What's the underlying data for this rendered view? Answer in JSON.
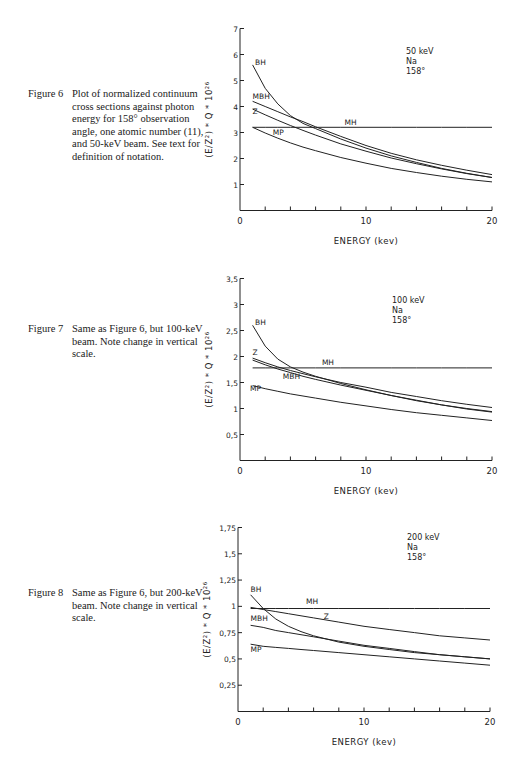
{
  "figures": [
    {
      "id": "fig6",
      "caption_label": "Figure 6",
      "caption_text": "Plot of normalized continuum cross sections against photon energy for 158° observation angle, one atomic number (11), and 50-keV beam. See text for definition of notation.",
      "annotation": [
        "50 keV",
        "Na",
        "158°"
      ]
    },
    {
      "id": "fig7",
      "caption_label": "Figure 7",
      "caption_text": "Same as Figure 6, but 100-keV beam. Note change in vertical scale.",
      "annotation": [
        "100 keV",
        "Na",
        "158°"
      ]
    },
    {
      "id": "fig8",
      "caption_label": "Figure 8",
      "caption_text": "Same as Figure 6, but 200-keV beam. Note change in vertical scale.",
      "annotation": [
        "200 keV",
        "Na",
        "158°"
      ]
    }
  ],
  "chart_data": [
    {
      "type": "line",
      "title": "50 keV Na 158°",
      "xlabel": "ENERGY (kev)",
      "ylabel": "(E/Z²) * Q * 10²⁶",
      "xlim": [
        0,
        20
      ],
      "ylim": [
        0,
        7
      ],
      "xticks": [
        0,
        2,
        4,
        6,
        8,
        10,
        12,
        14,
        16,
        18,
        20
      ],
      "xtick_labels": {
        "0": "0",
        "10": "10",
        "20": "20"
      },
      "yticks": [
        1,
        2,
        3,
        4,
        5,
        6,
        7
      ],
      "ytick_labels": [
        "1",
        "2",
        "3",
        "4",
        "5",
        "6",
        "7"
      ],
      "grid": false,
      "legend": "inline labels",
      "x": [
        1,
        2,
        3,
        4,
        5,
        6,
        8,
        10,
        12,
        14,
        16,
        18,
        20
      ],
      "series": [
        {
          "name": "BH",
          "values": [
            5.6,
            4.7,
            4.1,
            3.65,
            3.35,
            3.15,
            2.75,
            2.4,
            2.1,
            1.85,
            1.62,
            1.43,
            1.27
          ],
          "label_at": [
            1.2,
            5.6
          ]
        },
        {
          "name": "MBH",
          "values": [
            4.2,
            4.0,
            3.8,
            3.6,
            3.42,
            3.22,
            2.85,
            2.5,
            2.2,
            1.95,
            1.74,
            1.55,
            1.38
          ],
          "label_at": [
            1.0,
            4.3
          ]
        },
        {
          "name": "Z",
          "values": [
            3.9,
            3.68,
            3.47,
            3.27,
            3.08,
            2.9,
            2.56,
            2.28,
            2.02,
            1.8,
            1.6,
            1.42,
            1.27
          ],
          "label_at": [
            1.0,
            3.7
          ]
        },
        {
          "name": "MH",
          "values": [
            3.2,
            3.2,
            3.2,
            3.2,
            3.2,
            3.2,
            3.2,
            3.2,
            3.2,
            3.2,
            3.2,
            3.2,
            3.2
          ],
          "label_at": [
            8.3,
            3.3
          ]
        },
        {
          "name": "MP",
          "values": [
            3.2,
            2.98,
            2.78,
            2.6,
            2.44,
            2.3,
            2.04,
            1.82,
            1.62,
            1.46,
            1.32,
            1.2,
            1.1
          ],
          "label_at": [
            2.6,
            2.9
          ]
        }
      ]
    },
    {
      "type": "line",
      "title": "100 keV Na 158°",
      "xlabel": "ENERGY (kev)",
      "ylabel": "(E/Z²) * Q * 10²⁶",
      "xlim": [
        0,
        20
      ],
      "ylim": [
        0,
        3.5
      ],
      "xticks": [
        0,
        2,
        4,
        6,
        8,
        10,
        12,
        14,
        16,
        18,
        20
      ],
      "xtick_labels": {
        "0": "0",
        "10": "10",
        "20": "20"
      },
      "yticks": [
        0.5,
        1,
        1.5,
        2,
        2.5,
        3,
        3.5
      ],
      "ytick_labels": [
        "0,5",
        "1",
        "1,5",
        "2",
        "2,5",
        "3",
        "3,5"
      ],
      "grid": false,
      "legend": "inline labels",
      "x": [
        1,
        2,
        3,
        4,
        5,
        6,
        8,
        10,
        12,
        14,
        16,
        18,
        20
      ],
      "series": [
        {
          "name": "BH",
          "values": [
            2.6,
            2.2,
            1.95,
            1.8,
            1.7,
            1.62,
            1.48,
            1.36,
            1.25,
            1.15,
            1.07,
            0.99,
            0.93
          ],
          "label_at": [
            1.2,
            2.6
          ]
        },
        {
          "name": "Z",
          "values": [
            1.97,
            1.88,
            1.8,
            1.73,
            1.67,
            1.61,
            1.5,
            1.41,
            1.31,
            1.23,
            1.15,
            1.08,
            1.02
          ],
          "label_at": [
            1.0,
            2.02
          ]
        },
        {
          "name": "MBH",
          "values": [
            1.93,
            1.84,
            1.76,
            1.69,
            1.62,
            1.56,
            1.45,
            1.35,
            1.25,
            1.16,
            1.07,
            1.0,
            0.94
          ],
          "label_at": [
            3.4,
            1.57
          ]
        },
        {
          "name": "MH",
          "values": [
            1.78,
            1.78,
            1.78,
            1.78,
            1.78,
            1.78,
            1.78,
            1.78,
            1.78,
            1.78,
            1.78,
            1.78,
            1.78
          ],
          "label_at": [
            6.5,
            1.84
          ]
        },
        {
          "name": "MP",
          "values": [
            1.44,
            1.38,
            1.33,
            1.28,
            1.24,
            1.2,
            1.12,
            1.05,
            0.98,
            0.92,
            0.87,
            0.82,
            0.77
          ],
          "label_at": [
            0.8,
            1.33
          ]
        }
      ]
    },
    {
      "type": "line",
      "title": "200 keV Na 158°",
      "xlabel": "ENERGY (kev)",
      "ylabel": "(E/Z²) * Q * 10²⁶",
      "xlim": [
        0,
        20
      ],
      "ylim": [
        0,
        1.75
      ],
      "xticks": [
        0,
        2,
        4,
        6,
        8,
        10,
        12,
        14,
        16,
        18,
        20
      ],
      "xtick_labels": {
        "0": "0",
        "10": "10",
        "20": "20"
      },
      "yticks": [
        0.25,
        0.5,
        0.75,
        1,
        1.25,
        1.5,
        1.75
      ],
      "ytick_labels": [
        "0,25",
        "0,5",
        "0,75",
        "1",
        "1,25",
        "1,5",
        "1,75"
      ],
      "grid": false,
      "legend": "inline labels",
      "x": [
        1,
        2,
        3,
        4,
        5,
        6,
        8,
        10,
        12,
        14,
        16,
        18,
        20
      ],
      "series": [
        {
          "name": "BH",
          "values": [
            1.11,
            0.98,
            0.88,
            0.81,
            0.76,
            0.72,
            0.66,
            0.62,
            0.59,
            0.56,
            0.54,
            0.52,
            0.5
          ],
          "label_at": [
            1.0,
            1.14
          ]
        },
        {
          "name": "MH",
          "values": [
            0.98,
            0.98,
            0.98,
            0.98,
            0.98,
            0.98,
            0.98,
            0.98,
            0.98,
            0.98,
            0.98,
            0.98,
            0.98
          ],
          "label_at": [
            5.4,
            1.02
          ]
        },
        {
          "name": "Z",
          "values": [
            0.99,
            0.97,
            0.95,
            0.93,
            0.91,
            0.89,
            0.85,
            0.81,
            0.78,
            0.75,
            0.72,
            0.7,
            0.68
          ],
          "label_at": [
            6.8,
            0.88
          ]
        },
        {
          "name": "MBH",
          "values": [
            0.82,
            0.8,
            0.77,
            0.75,
            0.73,
            0.71,
            0.67,
            0.63,
            0.6,
            0.57,
            0.54,
            0.52,
            0.5
          ],
          "label_at": [
            1.0,
            0.86
          ]
        },
        {
          "name": "MP",
          "values": [
            0.64,
            0.62,
            0.61,
            0.6,
            0.59,
            0.58,
            0.56,
            0.54,
            0.52,
            0.5,
            0.48,
            0.46,
            0.44
          ],
          "label_at": [
            1.0,
            0.57
          ]
        }
      ]
    }
  ]
}
